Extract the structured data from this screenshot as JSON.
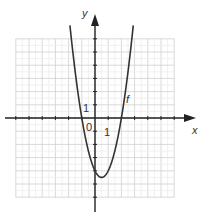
{
  "chart_data": {
    "type": "line",
    "title": "",
    "xlabel": "x",
    "ylabel": "y",
    "xlim": [
      -6,
      6
    ],
    "ylim": [
      -6,
      6
    ],
    "grid": true,
    "origin_label": "0",
    "x_tick_label": "1",
    "y_tick_label": "1",
    "series": [
      {
        "name": "f",
        "function": "2x^2 - 2x - 4",
        "x": [
          -1.9,
          -1.5,
          -1,
          -0.5,
          0,
          0.5,
          1,
          1.5,
          2,
          2.5,
          2.9
        ],
        "y": [
          7.02,
          3.5,
          0,
          -2.5,
          -4,
          -4.5,
          -4,
          -2.5,
          0,
          3.5,
          7.02
        ]
      }
    ]
  },
  "colors": {
    "grid": "#d6d6d6",
    "axis": "#222222",
    "curve": "#333333"
  }
}
